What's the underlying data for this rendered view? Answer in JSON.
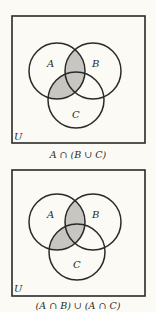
{
  "colors": {
    "background": "#fbfaf5",
    "stroke": "#2a2a2a",
    "shade": "#c8c6c0"
  },
  "diagrams": [
    {
      "universe_label": "U",
      "set_labels": {
        "a": "A",
        "b": "B",
        "c": "C"
      },
      "caption": "A ∩ (B ∪ C)",
      "shaded_region": "A ∩ (B ∪ C)",
      "box": {
        "x": 12,
        "y": 16,
        "w": 133,
        "h": 127
      },
      "circles": {
        "a": {
          "cx": 57,
          "cy": 71,
          "r": 28
        },
        "b": {
          "cx": 93,
          "cy": 71,
          "r": 28
        },
        "c": {
          "cx": 76,
          "cy": 100,
          "r": 28
        }
      }
    },
    {
      "universe_label": "U",
      "set_labels": {
        "a": "A",
        "b": "B",
        "c": "C"
      },
      "caption": "(A ∩ B) ∪ (A ∩ C)",
      "shaded_region": "(A ∩ B) ∪ (A ∩ C)",
      "box": {
        "x": 12,
        "y": 170,
        "w": 133,
        "h": 126
      },
      "circles": {
        "a": {
          "cx": 57,
          "cy": 222,
          "r": 28
        },
        "b": {
          "cx": 93,
          "cy": 222,
          "r": 28
        },
        "c": {
          "cx": 77,
          "cy": 252,
          "r": 28
        }
      }
    }
  ]
}
